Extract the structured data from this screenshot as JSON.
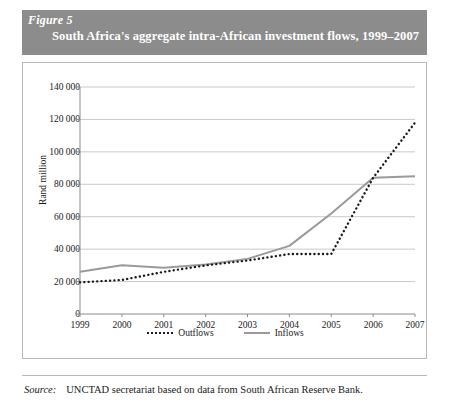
{
  "header": {
    "figure_label": "Figure 5",
    "title": "South Africa's aggregate intra-African investment flows, 1999–2007",
    "banner_color": "#8c8c8c",
    "banner_text_color": "#ffffff"
  },
  "source": {
    "label": "Source:",
    "text": "UNCTAD secretariat based on data from South African Reserve Bank."
  },
  "colors": {
    "outflows": "#1a1a1a",
    "inflows": "#9a9a9a",
    "gridline": "#c9c9c9",
    "axis": "#8a8a8a",
    "frame": "#b9b9b9"
  },
  "chart_data": {
    "type": "line",
    "title": "South Africa's aggregate intra-African investment flows, 1999–2007",
    "xlabel": "",
    "ylabel": "Rand million",
    "categories": [
      "1999",
      "2000",
      "2001",
      "2002",
      "2003",
      "2004",
      "2005",
      "2006",
      "2007"
    ],
    "x": [
      1999,
      2000,
      2001,
      2002,
      2003,
      2004,
      2005,
      2006,
      2007
    ],
    "series": [
      {
        "name": "Outflows",
        "style": "dotted",
        "color": "#1a1a1a",
        "values": [
          19500,
          21000,
          26000,
          30000,
          33000,
          37000,
          37000,
          84000,
          118000
        ]
      },
      {
        "name": "Inflows",
        "style": "solid",
        "color": "#9a9a9a",
        "values": [
          26000,
          30000,
          28500,
          30500,
          34000,
          42000,
          62000,
          84000,
          85000
        ]
      }
    ],
    "ylim": [
      0,
      140000
    ],
    "yticks": [
      0,
      20000,
      40000,
      60000,
      80000,
      100000,
      120000,
      140000
    ],
    "ytick_labels": [
      "0",
      "20 000",
      "40 000",
      "60 000",
      "80 000",
      "100 000",
      "120 000",
      "140 000"
    ],
    "xtick_labels": [
      "1999",
      "2000",
      "2001",
      "2002",
      "2003",
      "2004",
      "2005",
      "2006",
      "2007"
    ],
    "grid": true,
    "grid_axis": "y",
    "legend_position": "bottom",
    "legend_entries": [
      "Outflows",
      "Inflows"
    ]
  }
}
